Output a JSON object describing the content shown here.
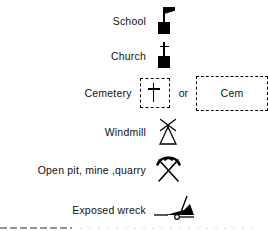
{
  "legend": {
    "title": "Map legend symbols",
    "rows": [
      {
        "label": "School",
        "symbol_name": "school-flag-symbol",
        "description": "Black filled square with flagpole and pennant flag"
      },
      {
        "label": "Church",
        "symbol_name": "church-cross-symbol",
        "description": "Black filled square topped with a cross"
      },
      {
        "label": "Cemetery",
        "symbol_name": "cemetery-cross-symbol",
        "description": "Dashed square outline enclosing a cross",
        "connector": "or",
        "alt_symbol_name": "cemetery-cem-label-symbol",
        "alt_text": "Cem",
        "alt_description": "Dashed rectangle outline enclosing the abbreviation Cem"
      },
      {
        "label": "Windmill",
        "symbol_name": "windmill-symbol",
        "description": "Open tower triangle with four-bladed rotor cross"
      },
      {
        "label": "Open pit, mine ,quarry",
        "symbol_name": "crossed-pickaxes-symbol",
        "description": "Two crossed pickaxes"
      },
      {
        "label": "Exposed wreck",
        "symbol_name": "exposed-wreck-symbol",
        "description": "Solid black hull on waterline with leaning mast"
      }
    ]
  },
  "colors": {
    "ink": "#000000",
    "text": "#111111",
    "background": "#ffffff"
  }
}
